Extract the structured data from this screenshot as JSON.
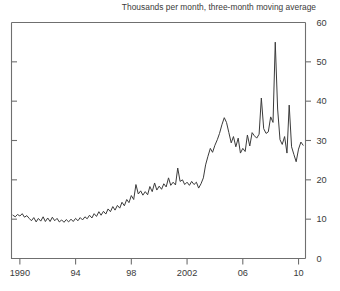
{
  "chart_data": {
    "type": "line",
    "title": "Thousands per month, three-month moving average",
    "xlabel": "",
    "ylabel": "",
    "xlim": [
      1989.4,
      2010.5
    ],
    "ylim": [
      0,
      60
    ],
    "grid": false,
    "legend": null,
    "y_ticks": [
      0,
      10,
      20,
      30,
      40,
      50,
      60
    ],
    "y_tick_labels": [
      "0",
      "10",
      "20",
      "30",
      "40",
      "50",
      "60"
    ],
    "y_axis_side": "right",
    "x_ticks": [
      1990,
      1994,
      1998,
      2002,
      2006,
      2010
    ],
    "x_tick_labels": [
      "1990",
      "94",
      "98",
      "2002",
      "06",
      "10"
    ],
    "line_color": "#3b3b3b",
    "line_width": 1,
    "series": [
      {
        "name": "Thousands per month, three-month moving average",
        "x": [
          1989.5,
          1989.67,
          1989.83,
          1990.0,
          1990.17,
          1990.33,
          1990.5,
          1990.67,
          1990.83,
          1991.0,
          1991.17,
          1991.33,
          1991.5,
          1991.67,
          1991.83,
          1992.0,
          1992.17,
          1992.33,
          1992.5,
          1992.67,
          1992.83,
          1993.0,
          1993.17,
          1993.33,
          1993.5,
          1993.67,
          1993.83,
          1994.0,
          1994.17,
          1994.33,
          1994.5,
          1994.67,
          1994.83,
          1995.0,
          1995.17,
          1995.33,
          1995.5,
          1995.67,
          1995.83,
          1996.0,
          1996.17,
          1996.33,
          1996.5,
          1996.67,
          1996.83,
          1997.0,
          1997.17,
          1997.33,
          1997.5,
          1997.67,
          1997.83,
          1998.0,
          1998.17,
          1998.33,
          1998.5,
          1998.67,
          1998.83,
          1999.0,
          1999.17,
          1999.33,
          1999.5,
          1999.67,
          1999.83,
          2000.0,
          2000.17,
          2000.33,
          2000.5,
          2000.67,
          2000.83,
          2001.0,
          2001.17,
          2001.33,
          2001.5,
          2001.67,
          2001.83,
          2002.0,
          2002.17,
          2002.33,
          2002.5,
          2002.67,
          2002.83,
          2003.0,
          2003.17,
          2003.33,
          2003.5,
          2003.67,
          2003.83,
          2004.0,
          2004.17,
          2004.33,
          2004.5,
          2004.67,
          2004.83,
          2005.0,
          2005.17,
          2005.33,
          2005.5,
          2005.67,
          2005.83,
          2006.0,
          2006.17,
          2006.33,
          2006.5,
          2006.67,
          2006.83,
          2007.0,
          2007.17,
          2007.33,
          2007.5,
          2007.67,
          2007.83,
          2008.0,
          2008.17,
          2008.33,
          2008.5,
          2008.67,
          2008.83,
          2009.0,
          2009.17,
          2009.33,
          2009.5,
          2009.67,
          2009.83,
          2010.0,
          2010.17,
          2010.33
        ],
        "values": [
          11.0,
          10.6,
          11.2,
          10.8,
          11.4,
          10.5,
          10.9,
          10.2,
          9.6,
          10.4,
          9.3,
          10.2,
          9.5,
          10.6,
          9.4,
          10.3,
          9.4,
          10.5,
          9.6,
          10.2,
          9.3,
          9.8,
          9.2,
          9.9,
          9.3,
          10.0,
          9.4,
          10.2,
          9.6,
          10.4,
          9.8,
          10.6,
          10.1,
          11.0,
          10.3,
          11.4,
          10.7,
          11.9,
          11.0,
          12.0,
          11.3,
          12.6,
          11.9,
          13.2,
          12.3,
          13.5,
          12.8,
          14.3,
          13.4,
          15.0,
          14.2,
          16.0,
          15.0,
          18.8,
          16.4,
          17.2,
          16.1,
          17.0,
          16.2,
          18.3,
          17.0,
          19.2,
          17.4,
          18.4,
          17.6,
          19.0,
          18.2,
          20.5,
          18.6,
          19.4,
          18.7,
          23.0,
          19.6,
          20.0,
          18.8,
          19.4,
          18.6,
          19.6,
          18.8,
          19.4,
          17.9,
          19.0,
          20.5,
          23.8,
          26.0,
          28.0,
          27.0,
          28.8,
          30.2,
          31.8,
          34.0,
          35.8,
          34.6,
          32.0,
          29.4,
          31.0,
          28.4,
          30.6,
          26.8,
          28.0,
          27.2,
          31.4,
          28.6,
          32.0,
          31.2,
          30.6,
          31.6,
          40.8,
          33.0,
          31.8,
          32.2,
          36.0,
          34.6,
          55.0,
          38.0,
          30.2,
          29.0,
          31.0,
          26.8,
          39.0,
          28.4,
          26.4,
          24.6,
          27.8,
          29.6,
          28.8
        ]
      }
    ]
  }
}
